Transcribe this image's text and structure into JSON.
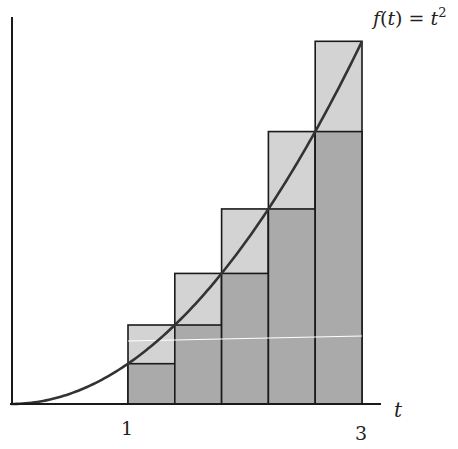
{
  "figure": {
    "function_label": "f(t) = t²",
    "function_label_parts": {
      "f": "f",
      "open": "(",
      "t": "t",
      "close": ") = ",
      "base": "t",
      "exp": "2"
    },
    "x_axis_label": "t",
    "x_tick_labels": [
      "1",
      "3"
    ],
    "caption_partial": "Figure 3.12: ... t³ ... 3"
  },
  "chart_data": {
    "type": "area",
    "title": "",
    "function": "t^2",
    "xlabel": "t",
    "ylabel": "",
    "xlim": [
      0,
      3.25
    ],
    "ylim": [
      0,
      9.5
    ],
    "x_ticks": [
      1,
      3
    ],
    "grid": false,
    "interval": [
      1,
      3
    ],
    "n": 5,
    "delta_t": 0.4,
    "partition": [
      1.0,
      1.4,
      1.8,
      2.2,
      2.6,
      3.0
    ],
    "series": [
      {
        "name": "left-hand rectangles",
        "x": [
          1.0,
          1.4,
          1.8,
          2.2,
          2.6
        ],
        "values": [
          1.0,
          1.96,
          3.24,
          4.84,
          6.76
        ],
        "color": "#aaaaaa"
      },
      {
        "name": "right-hand rectangles",
        "x": [
          1.0,
          1.4,
          1.8,
          2.2,
          2.6
        ],
        "values": [
          1.96,
          3.24,
          4.84,
          6.76,
          9.0
        ],
        "color": "#d4d4d4"
      }
    ],
    "curve_color": "#333333"
  },
  "colors": {
    "dark_fill": "#aaaaaa",
    "light_fill": "#d3d3d3",
    "stroke": "#1a1a1a",
    "curve": "#333333"
  }
}
